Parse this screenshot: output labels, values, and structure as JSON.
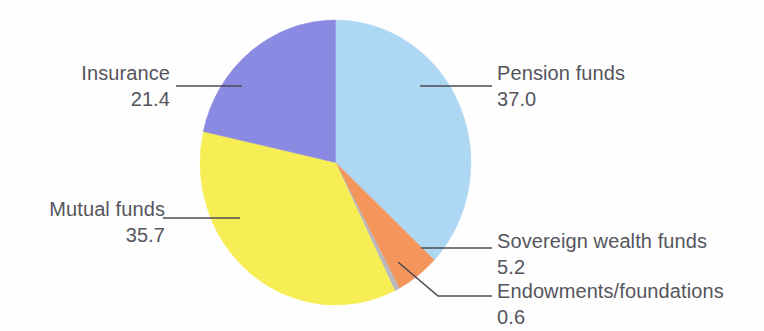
{
  "chart_data": {
    "type": "pie",
    "title": "",
    "subtitle": "",
    "xlabel": "",
    "ylabel": "",
    "legend_position": "none",
    "grid": false,
    "unit_note": "",
    "start_angle_deg": 0,
    "direction": "clockwise",
    "categories": [
      "Pension funds",
      "Sovereign wealth funds",
      "Endowments/foundations",
      "Mutual funds",
      "Insurance"
    ],
    "values": [
      37.0,
      5.2,
      0.6,
      35.7,
      21.4
    ],
    "value_labels": [
      "37.0",
      "5.2",
      "0.6",
      "35.7",
      "21.4"
    ],
    "colors": [
      "#aed7f4",
      "#f4955c",
      "#b9b9bd",
      "#f7ee55",
      "#8b8ae2"
    ],
    "slices": [
      {
        "name": "Pension funds",
        "value": 37.0,
        "value_label": "37.0",
        "color": "#aed7f4",
        "start_deg": 0.0,
        "end_deg": 133.2
      },
      {
        "name": "Sovereign wealth funds",
        "value": 5.2,
        "value_label": "5.2",
        "color": "#f4955c",
        "start_deg": 133.2,
        "end_deg": 151.92
      },
      {
        "name": "Endowments/foundations",
        "value": 0.6,
        "value_label": "0.6",
        "color": "#b9b9bd",
        "start_deg": 151.92,
        "end_deg": 154.08
      },
      {
        "name": "Mutual funds",
        "value": 35.7,
        "value_label": "35.7",
        "color": "#f7ee55",
        "start_deg": 154.08,
        "end_deg": 282.6
      },
      {
        "name": "Insurance",
        "value": 21.4,
        "value_label": "21.4",
        "color": "#8b8ae2",
        "start_deg": 282.6,
        "end_deg": 360.0
      }
    ]
  },
  "labels": {
    "pension": {
      "name": "Pension funds",
      "value": "37.0"
    },
    "insurance": {
      "name": "Insurance",
      "value": "21.4"
    },
    "mutual": {
      "name": "Mutual funds",
      "value": "35.7"
    },
    "sovereign": {
      "name": "Sovereign wealth funds",
      "value": "5.2"
    },
    "endowments": {
      "name": "Endowments/foundations",
      "value": "0.6"
    }
  },
  "style": {
    "text_color": "#55555c",
    "leader_color": "#4b4b53",
    "background": "#fefefe"
  }
}
